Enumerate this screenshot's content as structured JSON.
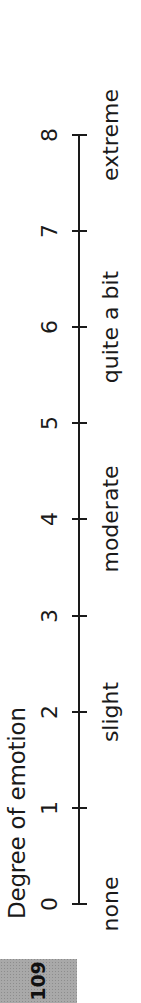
{
  "figure": {
    "title": "Degree of emotion",
    "orientation": "rotated-90-ccw",
    "scale": {
      "min": 0,
      "max": 8,
      "ticks": [
        "0",
        "1",
        "2",
        "3",
        "4",
        "5",
        "6",
        "7",
        "8"
      ],
      "descriptors": [
        {
          "label": "none",
          "at": 0
        },
        {
          "label": "slight",
          "at": 2
        },
        {
          "label": "moderate",
          "at": 4
        },
        {
          "label": "quite a bit",
          "at": 6
        },
        {
          "label": "extreme",
          "at": 8
        }
      ]
    },
    "colors": {
      "ink": "#1a1a1a",
      "page_box": "#a9a9a9",
      "background": "#ffffff"
    }
  },
  "page": {
    "number": "109"
  }
}
